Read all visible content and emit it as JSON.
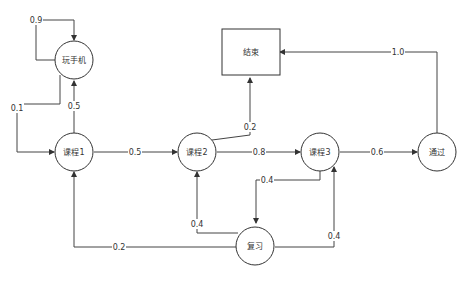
{
  "diagram": {
    "type": "markov-chain",
    "nodes": [
      {
        "id": "phone",
        "label": "玩手机",
        "shape": "circle"
      },
      {
        "id": "c1",
        "label": "课程1",
        "shape": "circle"
      },
      {
        "id": "c2",
        "label": "课程2",
        "shape": "circle"
      },
      {
        "id": "c3",
        "label": "课程3",
        "shape": "circle"
      },
      {
        "id": "pass",
        "label": "通过",
        "shape": "circle"
      },
      {
        "id": "review",
        "label": "复习",
        "shape": "circle"
      },
      {
        "id": "end",
        "label": "结束",
        "shape": "rectangle"
      }
    ],
    "edges": [
      {
        "from": "phone",
        "to": "phone",
        "label": "0.9"
      },
      {
        "from": "phone",
        "to": "c1",
        "label": "0.1"
      },
      {
        "from": "c1",
        "to": "phone",
        "label": "0.5"
      },
      {
        "from": "c1",
        "to": "c2",
        "label": "0.5"
      },
      {
        "from": "c2",
        "to": "end",
        "label": "0.2"
      },
      {
        "from": "c2",
        "to": "c3",
        "label": "0.8"
      },
      {
        "from": "c3",
        "to": "pass",
        "label": "0.6"
      },
      {
        "from": "c3",
        "to": "review",
        "label": "0.4"
      },
      {
        "from": "pass",
        "to": "end",
        "label": "1.0"
      },
      {
        "from": "review",
        "to": "c1",
        "label": "0.2"
      },
      {
        "from": "review",
        "to": "c2",
        "label": "0.4"
      },
      {
        "from": "review",
        "to": "c3",
        "label": "0.4"
      }
    ]
  }
}
